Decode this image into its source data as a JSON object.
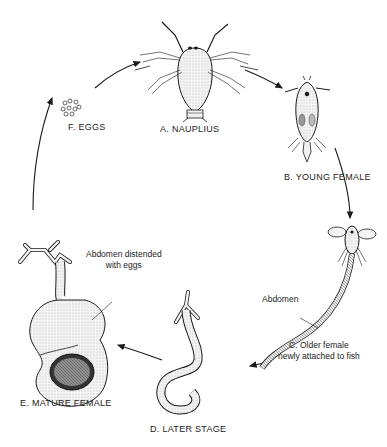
{
  "diagram": {
    "type": "life-cycle",
    "stages": [
      {
        "id": "A",
        "label": "A. NAUPLIUS"
      },
      {
        "id": "B",
        "label": "B. YOUNG FEMALE"
      },
      {
        "id": "C",
        "label_line1": "C. Older female",
        "label_line2": "newly attached to fish"
      },
      {
        "id": "D",
        "label": "D. LATER STAGE"
      },
      {
        "id": "E",
        "label": "E. MATURE FEMALE"
      },
      {
        "id": "F",
        "label": "F. EGGS"
      }
    ],
    "annotations": {
      "abdomen": "Abdomen",
      "distended_line1": "Abdomen distended",
      "distended_line2": "with eggs"
    },
    "flow": [
      "F",
      "A",
      "B",
      "C",
      "D",
      "E",
      "F"
    ],
    "colors": {
      "ink": "#1a1a1a",
      "stipple": "#e6e6e6",
      "background": "#ffffff"
    }
  }
}
